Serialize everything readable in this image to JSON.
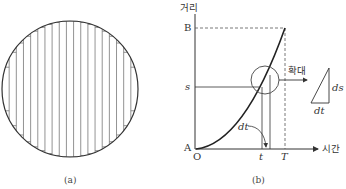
{
  "figure_a": {
    "caption": "(a)",
    "circle": {
      "cx": 70,
      "cy": 89,
      "r": 68
    },
    "strip_count": 19
  },
  "figure_b": {
    "caption": "(b)",
    "y_axis_label": "거리",
    "x_axis_label": "시간",
    "origin_label_A": "A",
    "origin_label_O": "O",
    "y_tick_B": "B",
    "y_tick_s": "s",
    "x_tick_t": "t",
    "x_tick_T": "T",
    "curve_label_dt": "dt",
    "magnify_label": "확대",
    "triangle_ds": "ds",
    "triangle_dt": "dt"
  },
  "colors": {
    "line": "#333333",
    "strip": "#777777",
    "dash": "#555555"
  }
}
